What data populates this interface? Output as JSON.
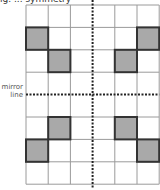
{
  "diagram": {
    "title_fragment": "ig. ... symmetry",
    "mirror_label_line1": "mirror",
    "mirror_label_line2": "line",
    "grid": {
      "columns": 6,
      "rows": 8,
      "vertical_mirror_after_column": 3,
      "horizontal_mirror_after_row": 4,
      "shaded_cells": [
        {
          "row": 1,
          "col": 0
        },
        {
          "row": 2,
          "col": 1
        },
        {
          "row": 1,
          "col": 5
        },
        {
          "row": 2,
          "col": 4
        },
        {
          "row": 5,
          "col": 1
        },
        {
          "row": 6,
          "col": 0
        },
        {
          "row": 5,
          "col": 4
        },
        {
          "row": 6,
          "col": 5
        }
      ]
    },
    "colors": {
      "grid_line": "#9a9a9a",
      "shade_fill": "#a9a9a9",
      "shade_border": "#333333",
      "mirror_line": "#222222"
    }
  }
}
